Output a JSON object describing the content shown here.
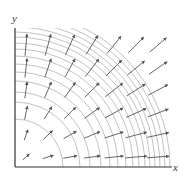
{
  "figure": {
    "x_label": "x",
    "y_label": "y",
    "origin_px": [
      15,
      167
    ],
    "x_axis_end_px": 172,
    "y_axis_top_px": 28,
    "arc_radii_px": [
      48,
      65,
      75,
      86,
      95,
      103,
      111,
      118,
      124,
      130,
      135,
      140,
      145,
      150,
      155
    ],
    "arrow_grid": {
      "xs": [
        26,
        48,
        70,
        92,
        114,
        136,
        158
      ],
      "ys": [
        157,
        135,
        113,
        90,
        68,
        45
      ]
    },
    "colors": {
      "axis": "#333333",
      "arc": "#a8a8a8",
      "arrow": "#555555",
      "background": "#ffffff"
    }
  }
}
